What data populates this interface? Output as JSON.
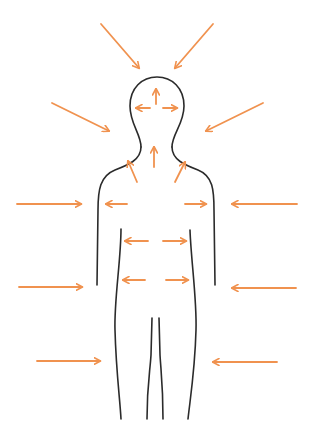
{
  "diagram": {
    "colors": {
      "outline": "#2b2b2b",
      "arrow": "#f0924f",
      "background": "#ffffff"
    },
    "external_arrows": [
      {
        "id": "ext-top-left",
        "from": [
          101,
          24
        ],
        "to": [
          139,
          68
        ]
      },
      {
        "id": "ext-top-right",
        "from": [
          213,
          24
        ],
        "to": [
          175,
          68
        ]
      },
      {
        "id": "ext-upper-left",
        "from": [
          52,
          103
        ],
        "to": [
          109,
          131
        ]
      },
      {
        "id": "ext-upper-right",
        "from": [
          263,
          103
        ],
        "to": [
          206,
          131
        ]
      },
      {
        "id": "ext-chest-left",
        "from": [
          17,
          204
        ],
        "to": [
          81,
          204
        ]
      },
      {
        "id": "ext-chest-right",
        "from": [
          297,
          204
        ],
        "to": [
          232,
          204
        ]
      },
      {
        "id": "ext-hip-left",
        "from": [
          19,
          287
        ],
        "to": [
          82,
          287
        ]
      },
      {
        "id": "ext-hip-right",
        "from": [
          296,
          288
        ],
        "to": [
          232,
          288
        ]
      },
      {
        "id": "ext-leg-left",
        "from": [
          37,
          361
        ],
        "to": [
          100,
          361
        ]
      },
      {
        "id": "ext-leg-right",
        "from": [
          277,
          362
        ],
        "to": [
          213,
          362
        ]
      }
    ],
    "internal_arrows": [
      {
        "id": "int-head-up",
        "from": [
          156,
          104
        ],
        "to": [
          156,
          89
        ]
      },
      {
        "id": "int-head-left",
        "from": [
          150,
          108
        ],
        "to": [
          136,
          108
        ]
      },
      {
        "id": "int-head-right",
        "from": [
          163,
          108
        ],
        "to": [
          177,
          108
        ]
      },
      {
        "id": "int-neck-up",
        "from": [
          154,
          167
        ],
        "to": [
          154,
          147
        ]
      },
      {
        "id": "int-neck-left",
        "from": [
          137,
          182
        ],
        "to": [
          128,
          161
        ]
      },
      {
        "id": "int-neck-right",
        "from": [
          175,
          182
        ],
        "to": [
          185,
          162
        ]
      },
      {
        "id": "int-chest-left",
        "from": [
          127,
          204
        ],
        "to": [
          106,
          204
        ]
      },
      {
        "id": "int-chest-right",
        "from": [
          185,
          204
        ],
        "to": [
          206,
          204
        ]
      },
      {
        "id": "int-waist-left",
        "from": [
          148,
          241
        ],
        "to": [
          125,
          241
        ]
      },
      {
        "id": "int-waist-right",
        "from": [
          163,
          241
        ],
        "to": [
          186,
          241
        ]
      },
      {
        "id": "int-hip-left",
        "from": [
          145,
          280
        ],
        "to": [
          123,
          280
        ]
      },
      {
        "id": "int-hip-right",
        "from": [
          166,
          280
        ],
        "to": [
          188,
          280
        ]
      }
    ]
  }
}
